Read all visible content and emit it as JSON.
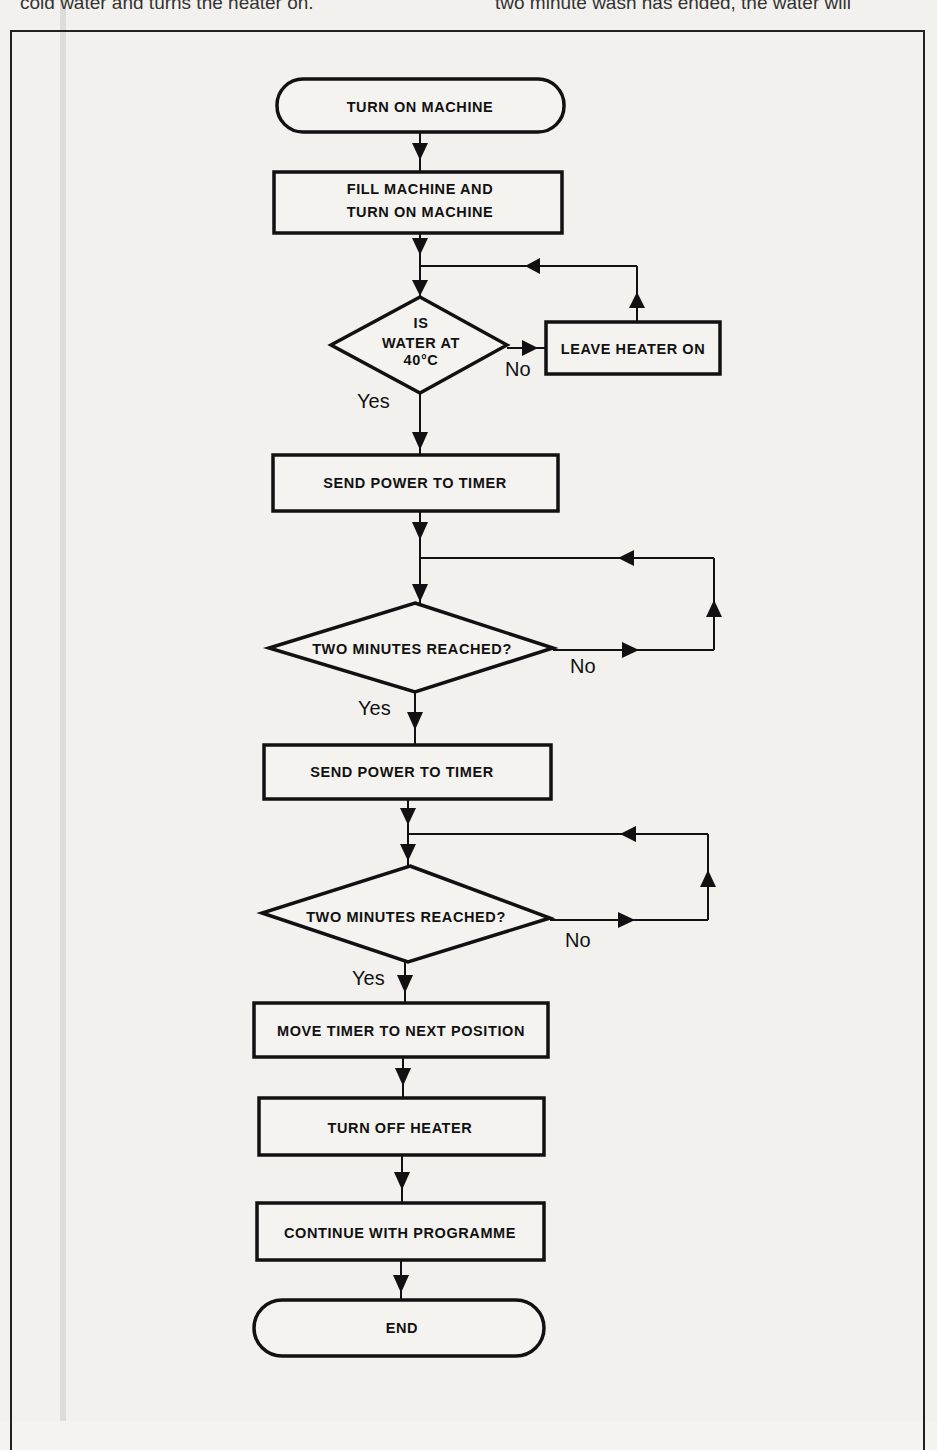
{
  "page": {
    "top_text_left": "cold water and turns the heater on.",
    "top_text_right": "two minute wash has ended, the water will"
  },
  "flowchart": {
    "nodes": {
      "start": "TURN ON MACHINE",
      "fill_line1": "FILL MACHINE AND",
      "fill_line2": "TURN ON MACHINE",
      "decision_temp_line1": "IS",
      "decision_temp_line2": "WATER AT",
      "decision_temp_line3": "40°C",
      "leave_heater": "LEAVE HEATER ON",
      "send_power_1": "SEND POWER TO TIMER",
      "decision_two_min_1": "TWO MINUTES REACHED?",
      "send_power_2": "SEND POWER TO TIMER",
      "decision_two_min_2": "TWO MINUTES REACHED?",
      "move_timer": "MOVE TIMER TO NEXT POSITION",
      "turn_off_heater": "TURN OFF HEATER",
      "continue_programme": "CONTINUE WITH PROGRAMME",
      "end": "END"
    },
    "edge_labels": {
      "temp_no": "No",
      "temp_yes": "Yes",
      "two_min_1_no": "No",
      "two_min_1_yes": "Yes",
      "two_min_2_no": "No",
      "two_min_2_yes": "Yes"
    }
  }
}
